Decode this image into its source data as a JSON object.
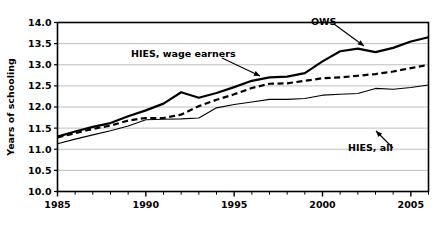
{
  "chart_data": {
    "type": "line",
    "title": "",
    "xlabel": "",
    "ylabel": "Years of schooling",
    "xlim": [
      1985,
      2006
    ],
    "ylim": [
      10.0,
      14.0
    ],
    "grid": true,
    "legend_position": "inline-annotations",
    "y_ticks": [
      "10.0",
      "10.5",
      "11.0",
      "11.5",
      "12.0",
      "12.5",
      "13.0",
      "13.5",
      "14.0"
    ],
    "x_ticks": [
      "1985",
      "1990",
      "1995",
      "2000",
      "2005"
    ],
    "x_minor_tick_step": 1,
    "x": [
      1985,
      1986,
      1987,
      1988,
      1989,
      1990,
      1991,
      1992,
      1993,
      1994,
      1995,
      1996,
      1997,
      1998,
      1999,
      2000,
      2001,
      2002,
      2003,
      2004,
      2005,
      2006
    ],
    "series": [
      {
        "name": "OWS",
        "style": "solid-thick",
        "values": [
          11.3,
          11.42,
          11.53,
          11.62,
          11.78,
          11.92,
          12.08,
          12.35,
          12.22,
          12.33,
          12.47,
          12.62,
          12.7,
          12.72,
          12.8,
          13.08,
          13.32,
          13.38,
          13.3,
          13.4,
          13.55,
          13.65
        ]
      },
      {
        "name": "HIES, wage earners",
        "style": "dashed",
        "values": [
          11.28,
          11.38,
          11.48,
          11.56,
          11.68,
          11.74,
          11.74,
          11.82,
          12.02,
          12.17,
          12.3,
          12.45,
          12.55,
          12.56,
          12.62,
          12.68,
          12.7,
          12.74,
          12.78,
          12.84,
          12.92,
          13.0
        ]
      },
      {
        "name": "HIES, all",
        "style": "solid-thin",
        "values": [
          11.13,
          11.24,
          11.34,
          11.44,
          11.55,
          11.7,
          11.71,
          11.72,
          11.74,
          11.98,
          12.06,
          12.12,
          12.18,
          12.18,
          12.2,
          12.28,
          12.3,
          12.32,
          12.44,
          12.42,
          12.46,
          12.52
        ]
      }
    ],
    "annotations": [
      {
        "label": "OWS",
        "text_x": 311,
        "text_y": 25,
        "arrow": {
          "x1": 334,
          "y1": 24,
          "x2": 364,
          "y2": 46
        }
      },
      {
        "label": "HIES, wage earners",
        "text_x": 131,
        "text_y": 57,
        "arrow": {
          "x1": 222,
          "y1": 58,
          "x2": 260,
          "y2": 76
        }
      },
      {
        "label": "HIES, all",
        "text_x": 348,
        "text_y": 151,
        "arrow": {
          "x1": 393,
          "y1": 148,
          "x2": 376,
          "y2": 131
        }
      }
    ]
  }
}
